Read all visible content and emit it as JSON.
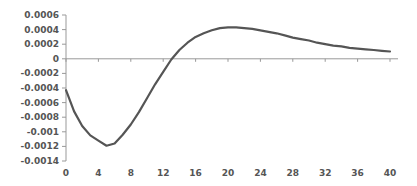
{
  "chart_data": {
    "type": "line",
    "title": "",
    "xlabel": "",
    "ylabel": "",
    "xlim": [
      0,
      40
    ],
    "ylim": [
      -0.0014,
      0.0006
    ],
    "grid": false,
    "legend": null,
    "x_ticks": [
      "0",
      "4",
      "8",
      "12",
      "16",
      "20",
      "24",
      "28",
      "32",
      "36",
      "40"
    ],
    "y_ticks": [
      "0.0006",
      "0.0004",
      "0.0002",
      "0",
      "-0.0002",
      "-0.0004",
      "-0.0006",
      "-0.0008",
      "-0.001",
      "-0.0012",
      "-0.0014"
    ],
    "series": [
      {
        "name": "response",
        "color": "#555555",
        "x": [
          0,
          1,
          2,
          3,
          4,
          5,
          6,
          7,
          8,
          9,
          10,
          11,
          12,
          13,
          14,
          15,
          16,
          17,
          18,
          19,
          20,
          21,
          22,
          23,
          24,
          25,
          26,
          27,
          28,
          29,
          30,
          31,
          32,
          33,
          34,
          35,
          36,
          37,
          38,
          39,
          40
        ],
        "values": [
          -0.00043,
          -0.00072,
          -0.00092,
          -0.00105,
          -0.00112,
          -0.00119,
          -0.00116,
          -0.00104,
          -0.0009,
          -0.00073,
          -0.00054,
          -0.00035,
          -0.00018,
          -1e-05,
          0.00012,
          0.00022,
          0.0003,
          0.00035,
          0.00039,
          0.00042,
          0.00043,
          0.00043,
          0.00042,
          0.00041,
          0.00039,
          0.00037,
          0.00035,
          0.00032,
          0.00029,
          0.00027,
          0.00025,
          0.00022,
          0.0002,
          0.00018,
          0.00017,
          0.00015,
          0.00014,
          0.00013,
          0.00012,
          0.00011,
          0.0001
        ]
      }
    ]
  }
}
